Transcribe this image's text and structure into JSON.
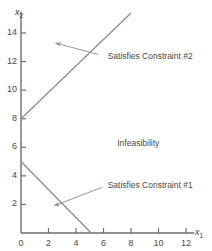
{
  "chart_data": {
    "type": "line",
    "title": "",
    "xlabel": "x1",
    "ylabel": "x2",
    "xlim": [
      0,
      12.6
    ],
    "ylim": [
      0,
      15.5
    ],
    "grid": false,
    "legend_position": "none",
    "xticks": [
      0,
      2,
      4,
      6,
      8,
      10,
      12
    ],
    "yticks": [
      2,
      4,
      6,
      8,
      10,
      12,
      14
    ],
    "xtick_labels": [
      "0",
      "2",
      "4",
      "6",
      "8",
      "10",
      "12"
    ],
    "ytick_labels": [
      "2",
      "4",
      "6",
      "8",
      "10",
      "12",
      "14"
    ],
    "series": [
      {
        "name": "Constraint #1 boundary",
        "points": [
          [
            0,
            5
          ],
          [
            5.1,
            0
          ]
        ],
        "color": "#8c8c8c"
      },
      {
        "name": "Constraint #2 boundary",
        "points": [
          [
            0,
            8
          ],
          [
            8.0,
            15.4
          ]
        ],
        "color": "#8c8c8c"
      }
    ],
    "annotations": [
      {
        "name": "satisfies-constraint-2",
        "text": "Satisfies Constraint #2",
        "text_x": 6.3,
        "text_y": 12.3,
        "arrow_from_x": 5.6,
        "arrow_from_y": 12.5,
        "arrow_to_x": 2.5,
        "arrow_to_y": 13.3
      },
      {
        "name": "infeasibility",
        "text": "Infeasibility",
        "text_x": 7.0,
        "text_y": 6.2,
        "arrow_from_x": null,
        "arrow_from_y": null,
        "arrow_to_x": null,
        "arrow_to_y": null
      },
      {
        "name": "satisfies-constraint-1",
        "text": "Satisfies Constraint #1",
        "text_x": 6.3,
        "text_y": 3.3,
        "arrow_from_x": 5.9,
        "arrow_from_y": 3.2,
        "arrow_to_x": 2.4,
        "arrow_to_y": 1.9
      }
    ]
  },
  "axes": {
    "x_axis_label": "x",
    "x_axis_sub": "1",
    "y_axis_label": "x",
    "y_axis_sub": "2"
  },
  "colors": {
    "line": "#8c8c8c",
    "axis": "#6e6e6e",
    "text": "#4a4a4a",
    "background": "#ffffff"
  }
}
